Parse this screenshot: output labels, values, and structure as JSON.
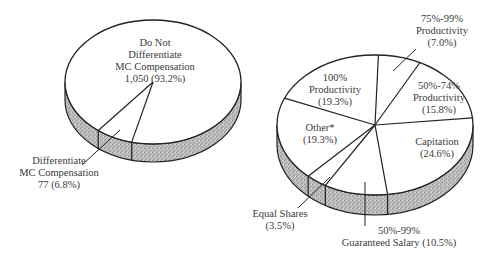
{
  "chart_data": [
    {
      "type": "pie",
      "style": "3d",
      "title": "",
      "slices": [
        {
          "label": "Do Not Differentiate MC Compensation",
          "count": 1050,
          "percent": 93.2
        },
        {
          "label": "Differentiate MC Compensation",
          "count": 77,
          "percent": 6.8
        }
      ]
    },
    {
      "type": "pie",
      "style": "3d",
      "title": "",
      "slices": [
        {
          "label": "75%-99% Productivity",
          "percent": 7.0
        },
        {
          "label": "50%-74% Productivity",
          "percent": 15.8
        },
        {
          "label": "Capitation",
          "percent": 24.6
        },
        {
          "label": "50%-99% Guaranteed Salary",
          "percent": 10.5
        },
        {
          "label": "Equal Shares",
          "percent": 3.5
        },
        {
          "label": "Other*",
          "percent": 19.3
        },
        {
          "label": "100% Productivity",
          "percent": 19.3
        }
      ]
    }
  ],
  "labels": {
    "left": {
      "not_diff": [
        "Do Not",
        "Differentiate",
        "MC Compensation",
        "1,050  (93.2%)"
      ],
      "diff": [
        "Differentiate",
        "MC Compensation",
        "77  (6.8%)"
      ]
    },
    "right": {
      "p75": [
        "75%-99%",
        "Productivity",
        "(7.0%)"
      ],
      "p50": [
        "50%-74%",
        "Productivity",
        "(15.8%)"
      ],
      "cap": [
        "Capitation",
        "(24.6%)"
      ],
      "sal": [
        "50%-99%",
        "Guaranteed Salary (10.5%)"
      ],
      "eq": [
        "Equal Shares",
        "(3.5%)"
      ],
      "other": [
        "Other*",
        "(19.3%)"
      ],
      "p100": [
        "100%",
        "Productivity",
        "(19.3%)"
      ]
    }
  },
  "colors": {
    "face": "#ffffff",
    "side": "#b8b8b8",
    "line": "#222222"
  }
}
